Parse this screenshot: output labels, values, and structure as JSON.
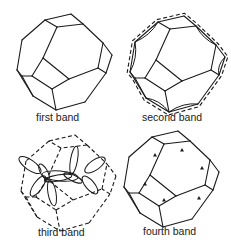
{
  "figure": {
    "panels": [
      {
        "id": "first",
        "label": "first band",
        "style": "solid-polyhedron"
      },
      {
        "id": "second",
        "label": "second band",
        "style": "dashed-zone-with-concave-surface"
      },
      {
        "id": "third",
        "label": "third band",
        "style": "dashed-zone-with-lobes"
      },
      {
        "id": "fourth",
        "label": "fourth band",
        "style": "solid-polyhedron-with-pockets"
      }
    ]
  },
  "colors": {
    "line": "#1a1a1a",
    "background": "#ffffff"
  }
}
